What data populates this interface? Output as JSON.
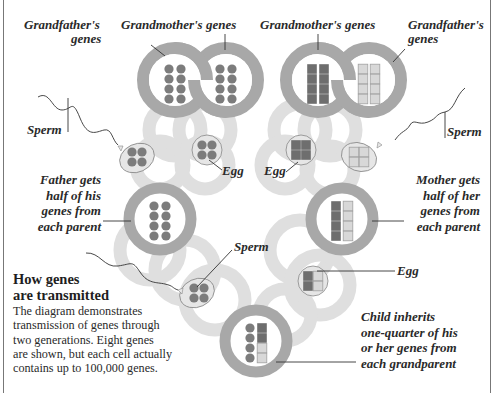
{
  "title_fragment": "",
  "colors": {
    "ring": "#a8a8a8",
    "ring_inner": "#ffffff",
    "ghost_chain": "#dcdcdc",
    "paternal_gene": "#7c7c7c",
    "maternal_dark_gene": "#6e6e6e",
    "maternal_light_gene": "#d6d6d6",
    "gamete_fill": "#e6e6e6",
    "text": "#2a2a2a"
  },
  "labels": {
    "grandfather_left": [
      "Grandfather's",
      "genes"
    ],
    "grandmother_left": "Grandmother's genes",
    "grandmother_right": "Grandmother's genes",
    "grandfather_right": [
      "Grandfather's",
      "genes"
    ],
    "sperm_left": "Sperm",
    "sperm_right": "Sperm",
    "egg_left": "Egg",
    "egg_right": "Egg",
    "father": [
      "Father gets",
      "half of his",
      "genes from",
      "each parent"
    ],
    "mother": [
      "Mother gets",
      "half of her",
      "genes from",
      "each parent"
    ],
    "sperm_bottom": "Sperm",
    "egg_bottom": "Egg",
    "child": [
      "Child inherits",
      "one-quarter of his",
      "or her genes from",
      "each grandparent"
    ]
  },
  "caption": {
    "heading": [
      "How genes",
      "are transmitted"
    ],
    "body": [
      "The diagram demonstrates",
      "transmission of genes through",
      "two generations. Eight genes",
      "are shown, but each cell actually",
      "contains up to 100,000 genes."
    ]
  },
  "cells": [
    {
      "id": "paternal-grandfather",
      "genes": "8 dark circles"
    },
    {
      "id": "paternal-grandmother",
      "genes": "8 dark circles"
    },
    {
      "id": "maternal-grandmother",
      "genes": "8 dark squares"
    },
    {
      "id": "maternal-grandfather",
      "genes": "8 light squares"
    },
    {
      "id": "father",
      "genes": "8 dark circles"
    },
    {
      "id": "mother",
      "genes": "4 dark squares + 4 light squares"
    },
    {
      "id": "child",
      "genes": "4 circles + 2 dark squares + 2 light squares"
    }
  ]
}
